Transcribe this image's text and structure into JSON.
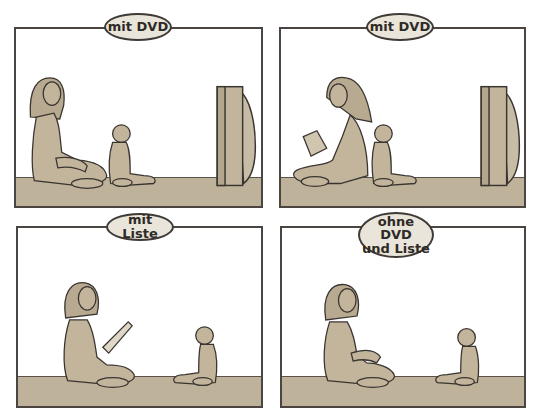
{
  "panels": [
    {
      "id": "top-left",
      "label": "mit DVD",
      "mother_activity": "sitting, watching",
      "child_activity": "watching TV",
      "has_tv": true
    },
    {
      "id": "top-right",
      "label": "mit DVD",
      "mother_activity": "reading a book",
      "child_activity": "watching TV",
      "has_tv": true
    },
    {
      "id": "bottom-left",
      "label": "mit Liste",
      "mother_activity": "reading a list to child",
      "child_activity": "facing mother",
      "has_tv": false
    },
    {
      "id": "bottom-right",
      "label_line1": "ohne DVD",
      "label_line2": "und Liste",
      "mother_activity": "sitting, facing child",
      "child_activity": "facing mother",
      "has_tv": false
    }
  ],
  "colors": {
    "figure_fill": "#c2b59c",
    "floor": "#bfb29a",
    "outline": "#3a3530",
    "bubble_fill": "#e9e5da",
    "background": "#ffffff"
  }
}
